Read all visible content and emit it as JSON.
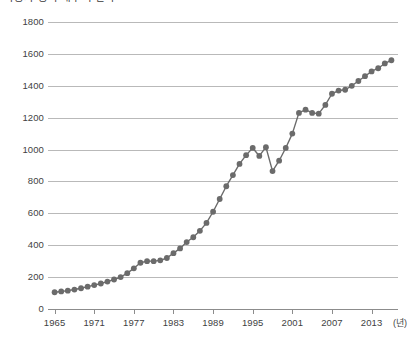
{
  "chart_data": {
    "type": "line",
    "title": "자동차 등록 대수의 변화",
    "xlabel": "(년)",
    "ylabel": "",
    "xlim": [
      1964,
      2017
    ],
    "ylim": [
      0,
      1800
    ],
    "ytick_values": [
      0,
      200,
      400,
      600,
      800,
      1000,
      1200,
      1400,
      1600,
      1800
    ],
    "ytick_labels": [
      "0",
      "200",
      "400",
      "600",
      "800",
      "1000",
      "1200",
      "1400",
      "1600",
      "1800"
    ],
    "xtick_values": [
      1965,
      1971,
      1977,
      1983,
      1989,
      1995,
      2001,
      2007,
      2013
    ],
    "xtick_labels": [
      "1965",
      "1971",
      "1977",
      "1983",
      "1989",
      "1995",
      "2001",
      "2007",
      "2013"
    ],
    "grid": "horizontal",
    "legend": "none",
    "marker": "circle",
    "marker_color": "#6b6b6b",
    "line_color": "#6b6b6b",
    "x": [
      1965,
      1966,
      1967,
      1968,
      1969,
      1970,
      1971,
      1972,
      1973,
      1974,
      1975,
      1976,
      1977,
      1978,
      1979,
      1980,
      1981,
      1982,
      1983,
      1984,
      1985,
      1986,
      1987,
      1988,
      1989,
      1990,
      1991,
      1992,
      1993,
      1994,
      1995,
      1996,
      1997,
      1998,
      1999,
      2000,
      2001,
      2002,
      2003,
      2004,
      2005,
      2006,
      2007,
      2008,
      2009,
      2010,
      2011,
      2012,
      2013,
      2014,
      2015,
      2016
    ],
    "values": [
      105,
      110,
      115,
      122,
      130,
      140,
      150,
      160,
      172,
      185,
      200,
      225,
      255,
      290,
      300,
      300,
      305,
      320,
      350,
      380,
      420,
      450,
      490,
      540,
      610,
      690,
      770,
      840,
      910,
      965,
      1010,
      960,
      1015,
      865,
      930,
      1010,
      1100,
      1230,
      1250,
      1230,
      1225,
      1280,
      1350,
      1370,
      1375,
      1400,
      1430,
      1460,
      1490,
      1510,
      1540,
      1560
    ]
  }
}
